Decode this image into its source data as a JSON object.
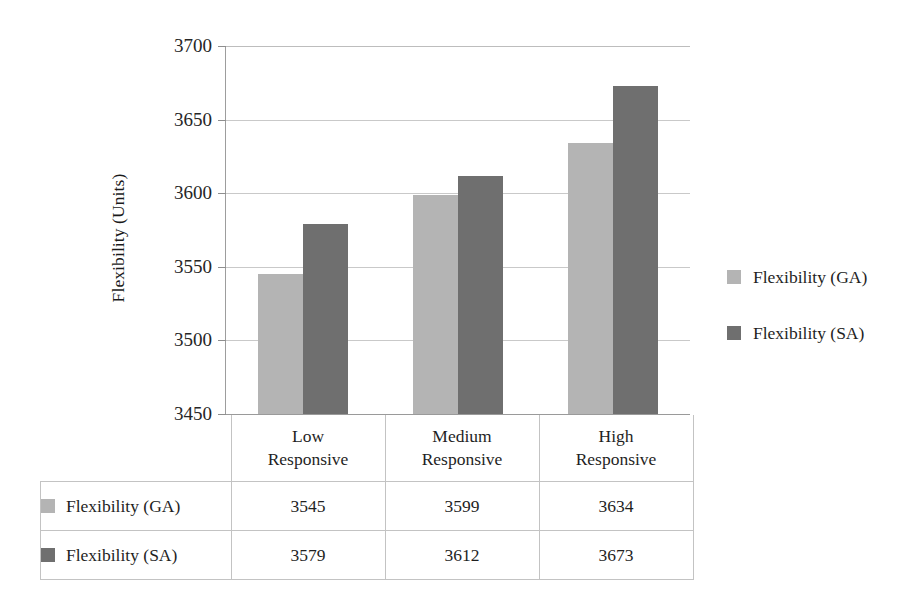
{
  "chart_data": {
    "type": "bar",
    "title": "",
    "xlabel": "",
    "ylabel": "Flexibility (Units)",
    "categories": [
      "Low Responsive",
      "Medium Responsive",
      "High Responsive"
    ],
    "category_lines": [
      [
        "Low",
        "Responsive"
      ],
      [
        "Medium",
        "Responsive"
      ],
      [
        "High",
        "Responsive"
      ]
    ],
    "series": [
      {
        "name": "Flexibility (GA)",
        "values": [
          3545,
          3599,
          3634
        ],
        "color": "#b4b4b4"
      },
      {
        "name": "Flexibility (SA)",
        "values": [
          3579,
          3612,
          3673
        ],
        "color": "#6f6f6f"
      }
    ],
    "ylim": [
      3450,
      3700
    ],
    "ytick_labels": [
      "3700",
      "3650",
      "3600",
      "3550",
      "3500",
      "3450"
    ],
    "ytick_values": [
      3700,
      3650,
      3600,
      3550,
      3500,
      3450
    ],
    "grid": true,
    "legend_position": "right"
  },
  "legend": {
    "items": [
      {
        "label": "Flexibility (GA)",
        "swatch": "ga"
      },
      {
        "label": "Flexibility (SA)",
        "swatch": "sa"
      }
    ]
  },
  "table": {
    "corner_label": "",
    "headers": [
      "Low Responsive",
      "Medium Responsive",
      "High Responsive"
    ],
    "rows": [
      {
        "label": "Flexibility (GA)",
        "swatch": "ga",
        "values": [
          "3545",
          "3599",
          "3634"
        ]
      },
      {
        "label": "Flexibility (SA)",
        "swatch": "sa",
        "values": [
          "3579",
          "3612",
          "3673"
        ]
      }
    ]
  },
  "axis": {
    "y_title": "Flexibility (Units)"
  },
  "colors": {
    "series_ga": "#b4b4b4",
    "series_sa": "#6f6f6f",
    "gridline": "#c9c9c9",
    "text": "#1f1f1f"
  }
}
